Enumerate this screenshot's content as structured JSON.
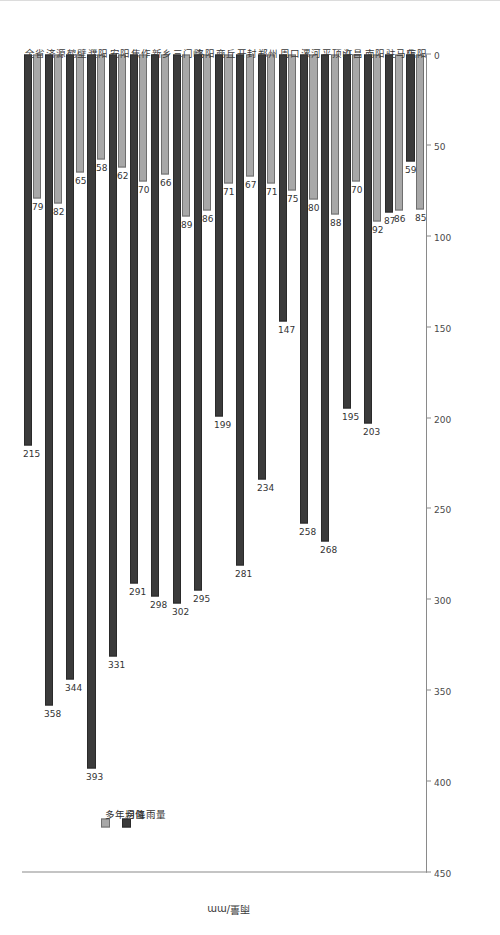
{
  "chart_data": {
    "type": "bar",
    "orientation": "horizontal",
    "title": "",
    "xlabel": "",
    "ylabel": "雨量/mm",
    "categories": [
      "全省",
      "济源",
      "鹤壁",
      "濮阳",
      "安阳",
      "焦作",
      "新乡",
      "三门峡",
      "洛阳",
      "商丘",
      "开封",
      "郑州",
      "周口",
      "漯河",
      "平顶山",
      "许昌",
      "南阳",
      "驻马店",
      "信阳"
    ],
    "series": [
      {
        "name": "多年均值",
        "color": "#a8a8a8",
        "values": [
          79,
          82,
          65,
          58,
          62,
          70,
          66,
          89,
          86,
          71,
          67,
          71,
          75,
          80,
          88,
          70,
          92,
          86,
          85
        ]
      },
      {
        "name": "月降雨量",
        "color": "#3b3b3b",
        "values": [
          215,
          358,
          344,
          393,
          331,
          291,
          298,
          302,
          295,
          199,
          281,
          234,
          147,
          258,
          268,
          195,
          203,
          87,
          59
        ]
      }
    ],
    "axis_ticks": [
      "450",
      "400",
      "350",
      "300",
      "250",
      "200",
      "150",
      "100",
      "50",
      "0"
    ],
    "xlim": [
      0,
      450
    ],
    "grid": false,
    "legend_position": "top-left"
  },
  "legend": {
    "items": [
      {
        "label": "多年均值"
      },
      {
        "label": "月降雨量"
      }
    ]
  }
}
